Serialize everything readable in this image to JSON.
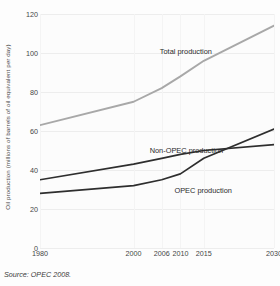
{
  "chart_data": {
    "type": "line",
    "title": "",
    "xlabel": "",
    "ylabel": "Oil production (millions of barrels of oil equivalent per day)",
    "x": [
      1980,
      2000,
      2006,
      2010,
      2015,
      2030
    ],
    "categories": [
      "1980",
      "2000",
      "2006",
      "2010",
      "2015",
      "2030"
    ],
    "xtick_labels": [
      "1980",
      "2000",
      "2006",
      "2010",
      "2015",
      "2030"
    ],
    "ytick_labels": [
      "0",
      "20",
      "40",
      "60",
      "80",
      "100",
      "120"
    ],
    "yticks": [
      0,
      20,
      40,
      60,
      80,
      100,
      120
    ],
    "ylim": [
      0,
      120
    ],
    "xlim": [
      1980,
      2030
    ],
    "grid": "horizontal",
    "legend": "inline-annotations",
    "series": [
      {
        "name": "Total production",
        "label": "Total production",
        "color": "#a8a8a8",
        "values": [
          63,
          75,
          82,
          88,
          96,
          114
        ]
      },
      {
        "name": "Non-OPEC production",
        "label": "Non-OPEC production",
        "color": "#2e2e2e",
        "values": [
          35,
          43,
          46,
          48,
          50,
          53
        ]
      },
      {
        "name": "OPEC production",
        "label": "OPEC production",
        "color": "#2e2e2e",
        "values": [
          28,
          32,
          35,
          38,
          46,
          61
        ]
      }
    ],
    "annotations": [
      {
        "text": "Total production",
        "series": "Total production"
      },
      {
        "text": "Non-OPEC production",
        "series": "Non-OPEC production"
      },
      {
        "text": "OPEC production",
        "series": "OPEC production"
      }
    ],
    "source_note": "Source: OPEC 2008."
  },
  "figure": {
    "source": "Source: OPEC 2008.",
    "background_color": "#fdfdfd",
    "grid_color": "#ededed",
    "axis_text_color": "#454545"
  }
}
